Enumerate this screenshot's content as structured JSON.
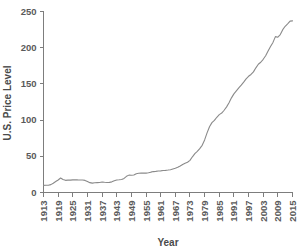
{
  "chart_data": {
    "type": "line",
    "title": "",
    "xlabel": "Year",
    "ylabel": "U.S. Price Level",
    "xlim": [
      1913,
      2015
    ],
    "ylim": [
      0,
      250
    ],
    "grid": false,
    "legend": "none",
    "line_color": "#8a8a8a",
    "axis_color": "#7d7d7d",
    "ytick_labels": [
      "0",
      "50",
      "100",
      "150",
      "200",
      "250"
    ],
    "ytick_values": [
      0,
      50,
      100,
      150,
      200,
      250
    ],
    "xtick_labels": [
      "1913",
      "1919",
      "1925",
      "1931",
      "1937",
      "1943",
      "1949",
      "1955",
      "1961",
      "1967",
      "1973",
      "1979",
      "1985",
      "1991",
      "1997",
      "2003",
      "2009",
      "2015"
    ],
    "xtick_values": [
      1913,
      1919,
      1925,
      1931,
      1937,
      1943,
      1949,
      1955,
      1961,
      1967,
      1973,
      1979,
      1985,
      1991,
      1997,
      2003,
      2009,
      2015
    ],
    "series": [
      {
        "name": "U.S. Price Level",
        "x": [
          1913,
          1914,
          1915,
          1916,
          1917,
          1918,
          1919,
          1920,
          1921,
          1922,
          1923,
          1924,
          1925,
          1926,
          1927,
          1928,
          1929,
          1930,
          1931,
          1932,
          1933,
          1934,
          1935,
          1936,
          1937,
          1938,
          1939,
          1940,
          1941,
          1942,
          1943,
          1944,
          1945,
          1946,
          1947,
          1948,
          1949,
          1950,
          1951,
          1952,
          1953,
          1954,
          1955,
          1956,
          1957,
          1958,
          1959,
          1960,
          1961,
          1962,
          1963,
          1964,
          1965,
          1966,
          1967,
          1968,
          1969,
          1970,
          1971,
          1972,
          1973,
          1974,
          1975,
          1976,
          1977,
          1978,
          1979,
          1980,
          1981,
          1982,
          1983,
          1984,
          1985,
          1986,
          1987,
          1988,
          1989,
          1990,
          1991,
          1992,
          1993,
          1994,
          1995,
          1996,
          1997,
          1998,
          1999,
          2000,
          2001,
          2002,
          2003,
          2004,
          2005,
          2006,
          2007,
          2008,
          2009,
          2010,
          2011,
          2012,
          2013,
          2014,
          2015
        ],
        "values": [
          9.9,
          10.0,
          10.1,
          10.9,
          12.8,
          15.1,
          17.3,
          20.0,
          17.9,
          16.8,
          17.1,
          17.1,
          17.5,
          17.7,
          17.4,
          17.2,
          17.2,
          16.7,
          15.2,
          13.6,
          12.9,
          13.4,
          13.7,
          13.9,
          14.4,
          14.1,
          13.9,
          14.0,
          14.7,
          16.3,
          17.3,
          17.6,
          18.0,
          19.5,
          22.3,
          24.0,
          23.8,
          24.1,
          26.0,
          26.6,
          26.8,
          26.9,
          26.8,
          27.2,
          28.1,
          28.9,
          29.2,
          29.6,
          29.9,
          30.3,
          30.6,
          31.0,
          31.5,
          32.5,
          33.4,
          34.8,
          36.7,
          38.8,
          40.5,
          41.8,
          44.4,
          49.3,
          53.8,
          56.9,
          60.6,
          65.2,
          72.6,
          82.4,
          90.9,
          96.5,
          99.6,
          103.9,
          107.6,
          109.7,
          113.6,
          118.3,
          124.0,
          130.7,
          136.2,
          140.3,
          144.5,
          148.2,
          152.4,
          156.9,
          160.5,
          163.0,
          166.6,
          172.2,
          177.1,
          179.9,
          184.0,
          188.9,
          195.3,
          201.6,
          207.3,
          215.3,
          214.5,
          218.1,
          224.9,
          229.6,
          233.0,
          236.7,
          237.0
        ]
      }
    ]
  },
  "labels": {
    "x_axis_title": "Year",
    "y_axis_title": "U.S. Price Level"
  }
}
